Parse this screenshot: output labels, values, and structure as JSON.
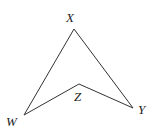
{
  "diagram": {
    "type": "quadrilateral",
    "points": {
      "X": {
        "label": "X",
        "x": 74,
        "y": 29
      },
      "Y": {
        "label": "Y",
        "x": 133,
        "y": 108
      },
      "Z": {
        "label": "Z",
        "x": 79,
        "y": 84
      },
      "W": {
        "label": "W",
        "x": 24,
        "y": 115
      }
    },
    "edges": [
      [
        "W",
        "X"
      ],
      [
        "X",
        "Y"
      ],
      [
        "Y",
        "Z"
      ],
      [
        "Z",
        "W"
      ]
    ],
    "stroke_color": "#333333"
  }
}
